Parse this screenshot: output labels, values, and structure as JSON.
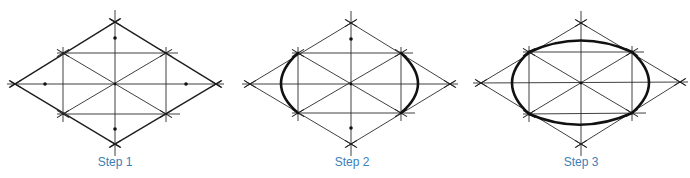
{
  "figure": {
    "line_color": "#1e1e1e",
    "label_color": "#3b80b8",
    "panels": [
      {
        "label": "Step 1",
        "description": "Rhombus with construction lines and midpoint marks",
        "vertices": {
          "left": [
            15,
            84
          ],
          "top": [
            115,
            22
          ],
          "right": [
            216,
            84
          ],
          "bottom": [
            115,
            144
          ]
        },
        "inner_points": {
          "ul": [
            63,
            53
          ],
          "ur": [
            166,
            53
          ],
          "ll": [
            63,
            114
          ],
          "lr": [
            166,
            114
          ]
        },
        "center": [
          115,
          84
        ],
        "midpoint_dots": [
          [
            115,
            38
          ],
          [
            115,
            129
          ],
          [
            45,
            84
          ],
          [
            186,
            84
          ]
        ]
      },
      {
        "label": "Step 2",
        "description": "Small arcs drawn at the left and right ends",
        "vertices": {
          "left": [
            250,
            84
          ],
          "top": [
            351,
            23
          ],
          "right": [
            450,
            84
          ],
          "bottom": [
            351,
            144
          ]
        },
        "inner_points": {
          "ul": [
            298,
            53
          ],
          "ur": [
            401,
            53
          ],
          "ll": [
            298,
            113
          ],
          "lr": [
            401,
            113
          ]
        },
        "center": [
          351,
          84
        ],
        "midpoint_dots": [
          [
            351,
            39
          ],
          [
            351,
            128
          ]
        ]
      },
      {
        "label": "Step 3",
        "description": "Large arcs complete the isometric ellipse",
        "vertices": {
          "left": [
            481,
            83
          ],
          "top": [
            581,
            23
          ],
          "right": [
            680,
            82
          ],
          "bottom": [
            581,
            144
          ]
        },
        "inner_points": {
          "ul": [
            529,
            52
          ],
          "ur": [
            632,
            52
          ],
          "ll": [
            529,
            114
          ],
          "lr": [
            632,
            113
          ]
        },
        "center": [
          581,
          83
        ]
      }
    ]
  }
}
